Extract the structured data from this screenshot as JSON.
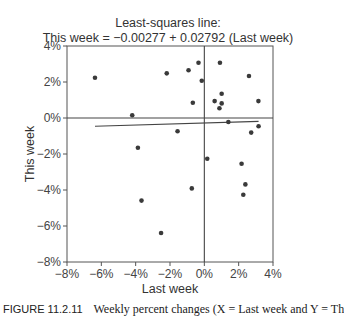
{
  "chart_data": {
    "type": "scatter",
    "title": "Least-squares line:",
    "subtitle": "This week = −0.00277 + 0.02792 (Last week)",
    "xlabel": "Last week",
    "ylabel": "This week",
    "xlim": [
      -8,
      4
    ],
    "ylim": [
      -8,
      4
    ],
    "x_ticks": [
      "-8%",
      "-6%",
      "-4%",
      "-2%",
      "0%",
      "2%",
      "4%"
    ],
    "y_ticks": [
      "4%",
      "2%",
      "0%",
      "-2%",
      "-4%",
      "-6%",
      "-8%"
    ],
    "x_tick_values": [
      -8,
      -6,
      -4,
      -2,
      0,
      2,
      4
    ],
    "y_tick_values": [
      4,
      2,
      0,
      -2,
      -4,
      -6,
      -8
    ],
    "grid": false,
    "reference_lines": {
      "x0": true,
      "y0": true
    },
    "regression": {
      "intercept": -0.00277,
      "slope": 0.02792,
      "x_from": -6.37,
      "x_to": 3.16
    },
    "points": [
      {
        "x": -6.37,
        "y": 2.24
      },
      {
        "x": -4.2,
        "y": 0.15
      },
      {
        "x": -3.87,
        "y": -1.65
      },
      {
        "x": -3.66,
        "y": -4.59
      },
      {
        "x": -2.52,
        "y": -6.39
      },
      {
        "x": -2.19,
        "y": 2.48
      },
      {
        "x": -1.56,
        "y": -0.74
      },
      {
        "x": -0.92,
        "y": 2.65
      },
      {
        "x": -0.73,
        "y": -3.91
      },
      {
        "x": -0.67,
        "y": 0.85
      },
      {
        "x": -0.34,
        "y": 3.07
      },
      {
        "x": -0.15,
        "y": 2.07
      },
      {
        "x": 0.17,
        "y": -2.26
      },
      {
        "x": 0.6,
        "y": 0.94
      },
      {
        "x": 0.88,
        "y": 0.54
      },
      {
        "x": 0.91,
        "y": 3.07
      },
      {
        "x": 1.01,
        "y": 1.35
      },
      {
        "x": 1.01,
        "y": 0.81
      },
      {
        "x": 1.4,
        "y": -0.22
      },
      {
        "x": 2.17,
        "y": -2.54
      },
      {
        "x": 2.27,
        "y": -4.26
      },
      {
        "x": 2.39,
        "y": -3.69
      },
      {
        "x": 2.6,
        "y": 2.33
      },
      {
        "x": 2.73,
        "y": -0.81
      },
      {
        "x": 3.15,
        "y": 0.94
      },
      {
        "x": 3.16,
        "y": -0.46
      }
    ]
  },
  "caption": {
    "figure_number": "FIGURE 11.2.11",
    "text": "Weekly percent changes (X = Last week and Y = Th"
  }
}
